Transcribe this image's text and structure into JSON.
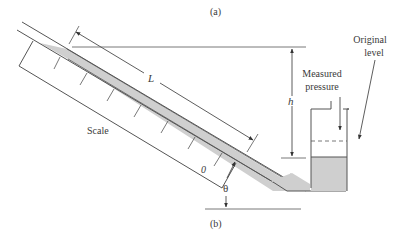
{
  "figure": {
    "label_top": "(a)",
    "label_bottom": "(b)"
  },
  "labels": {
    "length": "L",
    "height": "h",
    "angle": "θ",
    "zero": "0",
    "scale": "Scale",
    "measured_pressure_line1": "Measured",
    "measured_pressure_line2": "pressure",
    "original_level_line1": "Original",
    "original_level_line2": "level"
  },
  "colors": {
    "line": "#555555",
    "fluid": "#cfcfcf",
    "text": "#3a3a3a"
  }
}
